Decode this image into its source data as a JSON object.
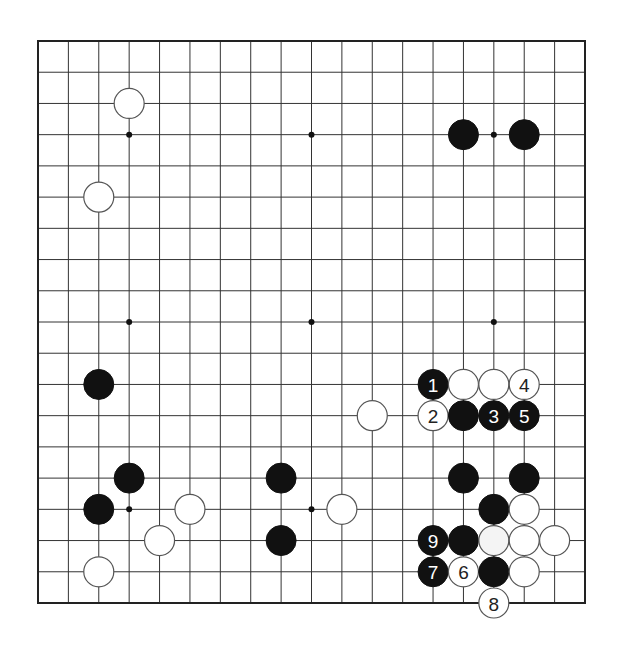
{
  "diagram": {
    "type": "go-board",
    "board_size": 19,
    "colors": {
      "line": "#333333",
      "edge": "#222222",
      "black_stone": "#111111",
      "white_stone": "#ffffff",
      "white_stone_outline": "#555555",
      "background": "#ffffff"
    },
    "geometry": {
      "x0": 38,
      "y0": 41,
      "x1": 585,
      "y1": 603,
      "stone_radius": 15,
      "star_radius": 3
    },
    "star_points": [
      [
        3,
        3
      ],
      [
        9,
        3
      ],
      [
        15,
        3
      ],
      [
        3,
        9
      ],
      [
        9,
        9
      ],
      [
        15,
        9
      ],
      [
        3,
        15
      ],
      [
        9,
        15
      ],
      [
        15,
        15
      ]
    ],
    "stones": [
      {
        "color": "white",
        "col": 3,
        "row": 2,
        "label": ""
      },
      {
        "color": "white",
        "col": 2,
        "row": 5,
        "label": ""
      },
      {
        "color": "black",
        "col": 14,
        "row": 3,
        "label": ""
      },
      {
        "color": "black",
        "col": 16,
        "row": 3,
        "label": ""
      },
      {
        "color": "black",
        "col": 2,
        "row": 11,
        "label": ""
      },
      {
        "color": "white",
        "col": 11,
        "row": 12,
        "label": ""
      },
      {
        "color": "black",
        "col": 3,
        "row": 14,
        "label": ""
      },
      {
        "color": "black",
        "col": 2,
        "row": 15,
        "label": ""
      },
      {
        "color": "white",
        "col": 5,
        "row": 15,
        "label": ""
      },
      {
        "color": "white",
        "col": 4,
        "row": 16,
        "label": ""
      },
      {
        "color": "white",
        "col": 2,
        "row": 17,
        "label": ""
      },
      {
        "color": "black",
        "col": 8,
        "row": 14,
        "label": ""
      },
      {
        "color": "white",
        "col": 10,
        "row": 15,
        "label": ""
      },
      {
        "color": "black",
        "col": 8,
        "row": 16,
        "label": ""
      },
      {
        "color": "black",
        "col": 13,
        "row": 11,
        "label": "1"
      },
      {
        "color": "white",
        "col": 14,
        "row": 11,
        "label": ""
      },
      {
        "color": "white",
        "col": 15,
        "row": 11,
        "label": ""
      },
      {
        "color": "white",
        "col": 16,
        "row": 11,
        "label": "4"
      },
      {
        "color": "white",
        "col": 13,
        "row": 12,
        "label": "2"
      },
      {
        "color": "black",
        "col": 14,
        "row": 12,
        "label": ""
      },
      {
        "color": "black",
        "col": 15,
        "row": 12,
        "label": "3"
      },
      {
        "color": "black",
        "col": 16,
        "row": 12,
        "label": "5"
      },
      {
        "color": "black",
        "col": 14,
        "row": 14,
        "label": ""
      },
      {
        "color": "black",
        "col": 16,
        "row": 14,
        "label": ""
      },
      {
        "color": "black",
        "col": 15,
        "row": 15,
        "label": ""
      },
      {
        "color": "white",
        "col": 16,
        "row": 15,
        "label": ""
      },
      {
        "color": "black",
        "col": 13,
        "row": 16,
        "label": "9"
      },
      {
        "color": "black",
        "col": 14,
        "row": 16,
        "label": ""
      },
      {
        "color": "white",
        "col": 15,
        "row": 16,
        "label": "",
        "tinted": true
      },
      {
        "color": "white",
        "col": 16,
        "row": 16,
        "label": ""
      },
      {
        "color": "white",
        "col": 17,
        "row": 16,
        "label": ""
      },
      {
        "color": "black",
        "col": 13,
        "row": 17,
        "label": "7"
      },
      {
        "color": "white",
        "col": 14,
        "row": 17,
        "label": "6"
      },
      {
        "color": "black",
        "col": 15,
        "row": 17,
        "label": ""
      },
      {
        "color": "white",
        "col": 16,
        "row": 17,
        "label": ""
      },
      {
        "color": "white",
        "col": 15,
        "row": 18,
        "label": "8"
      }
    ],
    "move_sequence": [
      {
        "move": 1,
        "color": "black",
        "col": 13,
        "row": 11
      },
      {
        "move": 2,
        "color": "white",
        "col": 13,
        "row": 12
      },
      {
        "move": 3,
        "color": "black",
        "col": 15,
        "row": 12
      },
      {
        "move": 4,
        "color": "white",
        "col": 16,
        "row": 11
      },
      {
        "move": 5,
        "color": "black",
        "col": 16,
        "row": 12
      },
      {
        "move": 6,
        "color": "white",
        "col": 14,
        "row": 17
      },
      {
        "move": 7,
        "color": "black",
        "col": 13,
        "row": 17
      },
      {
        "move": 8,
        "color": "white",
        "col": 15,
        "row": 18
      },
      {
        "move": 9,
        "color": "black",
        "col": 13,
        "row": 16
      }
    ]
  }
}
